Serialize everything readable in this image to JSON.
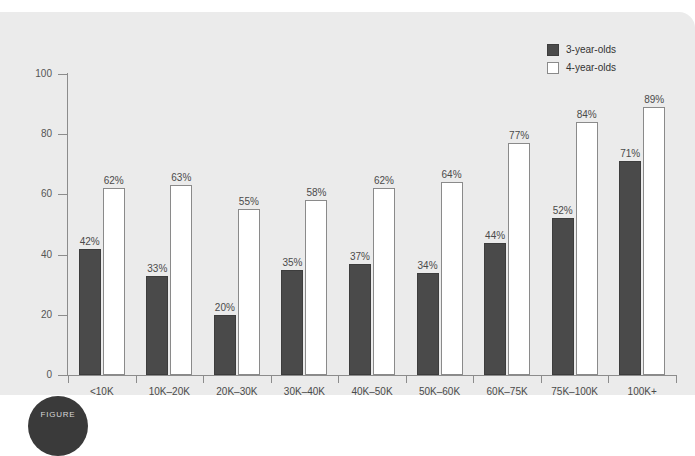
{
  "chart_data": {
    "type": "bar",
    "title": "",
    "subtitle": "",
    "xlabel": "",
    "ylabel": "",
    "ylim": [
      0,
      100
    ],
    "yticks": [
      0,
      20,
      40,
      60,
      80,
      100
    ],
    "grid": false,
    "legend_position": "top-right",
    "categories": [
      "<10K",
      "10K–20K",
      "20K–30K",
      "30K–40K",
      "40K–50K",
      "50K–60K",
      "60K–75K",
      "75K–100K",
      "100K+"
    ],
    "series": [
      {
        "name": "3-year-olds",
        "color": "#4a4a4a",
        "values": [
          42,
          33,
          20,
          35,
          37,
          34,
          44,
          52,
          71
        ],
        "labels": [
          "42%",
          "33%",
          "20%",
          "35%",
          "37%",
          "34%",
          "44%",
          "52%",
          "71%"
        ]
      },
      {
        "name": "4-year-olds",
        "color": "#ffffff",
        "values": [
          62,
          63,
          55,
          58,
          62,
          64,
          77,
          84,
          89
        ],
        "labels": [
          "62%",
          "63%",
          "55%",
          "58%",
          "62%",
          "64%",
          "77%",
          "84%",
          "89%"
        ]
      }
    ]
  },
  "legend": {
    "items": [
      {
        "label": "3-year-olds",
        "style": "dark"
      },
      {
        "label": "4-year-olds",
        "style": "light"
      }
    ]
  },
  "axis": {
    "y_tick_labels": [
      "0",
      "20",
      "40",
      "60",
      "80",
      "100"
    ]
  },
  "figure_badge": {
    "label": "FIGURE"
  }
}
